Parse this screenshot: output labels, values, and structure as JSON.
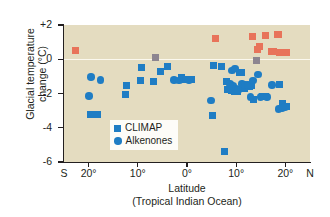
{
  "chart_data": {
    "type": "scatter",
    "title": "",
    "xlabel": "Latitude",
    "xlabel_sub": "(Tropical Indian Ocean)",
    "ylabel": "Glacial temperature",
    "ylabel_line2": "change (°C)",
    "xlim": [
      -25,
      25
    ],
    "ylim": [
      -6,
      2
    ],
    "grid": false,
    "zero_line": true,
    "x_hemisphere_left": "S",
    "x_hemisphere_right": "N",
    "xticks": [
      -25,
      -20,
      -10,
      0,
      10,
      20,
      25
    ],
    "xtick_labels": [
      "S",
      "20°",
      "10°",
      "0°",
      "10°",
      "20°",
      "N"
    ],
    "yticks": [
      2,
      0,
      -2,
      -4,
      -6
    ],
    "ytick_labels": [
      "+2",
      "0",
      "-2",
      "-4",
      "-6"
    ],
    "legend_position": "lower-center-left",
    "colors": {
      "climap": "#1f7dc4",
      "alkenones": "#1f7dc4",
      "climap_warm": "#e8735a",
      "overlap_gray": "#8d8590",
      "plot_background": "#e4dcc0",
      "axis": "#231f20",
      "zero_line": "#fbf8ee"
    },
    "series": [
      {
        "name": "CLIMAP",
        "marker": "square",
        "color": "#1f7dc4",
        "points": [
          [
            -9.2,
            -0.5
          ],
          [
            -9.4,
            -1.25
          ],
          [
            -12.3,
            -1.55
          ],
          [
            -12.6,
            -2.05
          ],
          [
            -19.6,
            -3.2
          ],
          [
            -18.2,
            -3.2
          ],
          [
            -6.8,
            -1.3
          ],
          [
            -5.4,
            -0.7
          ],
          [
            -3.9,
            -0.45
          ],
          [
            -1.2,
            -1.05
          ],
          [
            -0.4,
            -1.2
          ],
          [
            1.0,
            -1.2
          ],
          [
            5.1,
            -3.3
          ],
          [
            5.3,
            -0.35
          ],
          [
            7.0,
            -0.4
          ],
          [
            7.6,
            -5.4
          ],
          [
            8.0,
            -1.3
          ],
          [
            8.3,
            -1.75
          ],
          [
            9.0,
            -1.85
          ],
          [
            9.6,
            -1.9
          ],
          [
            10.2,
            -1.9
          ],
          [
            10.6,
            -0.75
          ],
          [
            11.0,
            -0.75
          ],
          [
            11.6,
            -1.7
          ],
          [
            12.7,
            -1.6
          ],
          [
            13.2,
            -1.55
          ],
          [
            13.6,
            -2.35
          ],
          [
            15.4,
            -2.15
          ],
          [
            16.0,
            -2.15
          ],
          [
            18.9,
            -1.5
          ],
          [
            19.4,
            -2.6
          ],
          [
            20.2,
            -2.75
          ]
        ]
      },
      {
        "name": "Alkenones",
        "marker": "circle",
        "color": "#1f7dc4",
        "points": [
          [
            -19.5,
            -1.05
          ],
          [
            -17.6,
            -1.2
          ],
          [
            -19.9,
            -2.15
          ],
          [
            -2.6,
            -1.2
          ],
          [
            -1.6,
            -1.25
          ],
          [
            0.4,
            -1.2
          ],
          [
            4.9,
            -2.4
          ],
          [
            8.7,
            -1.45
          ],
          [
            9.3,
            -1.55
          ],
          [
            9.1,
            -0.65
          ],
          [
            9.8,
            -0.55
          ],
          [
            10.0,
            -1.75
          ],
          [
            10.4,
            -1.8
          ],
          [
            11.2,
            -1.45
          ],
          [
            11.8,
            -1.5
          ],
          [
            12.4,
            -1.5
          ],
          [
            12.9,
            -2.2
          ],
          [
            13.4,
            -1.25
          ],
          [
            14.4,
            -0.9
          ],
          [
            14.9,
            -2.2
          ],
          [
            16.3,
            -2.2
          ],
          [
            17.3,
            -1.5
          ],
          [
            18.6,
            -2.9
          ],
          [
            19.3,
            -2.85
          ],
          [
            19.9,
            -2.8
          ]
        ]
      },
      {
        "name": "CLIMAP warm",
        "marker": "square",
        "color": "#e8735a",
        "points": [
          [
            -22.7,
            0.5
          ],
          [
            5.7,
            1.2
          ],
          [
            13.3,
            1.35
          ],
          [
            14.3,
            0.55
          ],
          [
            14.7,
            0.75
          ],
          [
            15.9,
            1.4
          ],
          [
            17.1,
            0.45
          ],
          [
            17.6,
            0.45
          ],
          [
            18.3,
            1.45
          ],
          [
            18.6,
            1.45
          ],
          [
            18.9,
            0.4
          ],
          [
            19.6,
            0.42
          ],
          [
            20.2,
            0.42
          ]
        ]
      },
      {
        "name": "Overlapping",
        "marker": "square",
        "color": "#8d8590",
        "points": [
          [
            -6.5,
            0.1
          ],
          [
            14.2,
            -0.1
          ]
        ]
      }
    ]
  },
  "legend": {
    "items": [
      {
        "label": "CLIMAP",
        "marker": "square"
      },
      {
        "label": "Alkenones",
        "marker": "circle"
      }
    ]
  }
}
